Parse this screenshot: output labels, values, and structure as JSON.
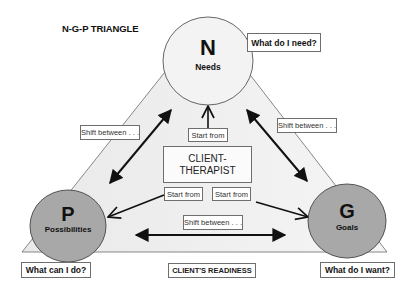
{
  "title": "N-G-P TRIANGLE",
  "nodes": {
    "needs": {
      "letter": "N",
      "name": "Needs",
      "question": "What do I need?"
    },
    "possibilities": {
      "letter": "P",
      "name": "Possibilities",
      "question": "What can I do?"
    },
    "goals": {
      "letter": "G",
      "name": "Goals",
      "question": "What do I want?"
    }
  },
  "center": {
    "line1": "CLIENT-",
    "line2": "THERAPIST"
  },
  "edges": {
    "shift_left": "Shift between . . .",
    "shift_right": "Shift between . . .",
    "shift_bottom": "Shift between . . .",
    "start_top": "Start from",
    "start_left": "Start from",
    "start_right": "Start from"
  },
  "base_label": "CLIENT'S READINESS",
  "colors": {
    "triangle_fill": "#efefef",
    "needs_fill": "#f2f2f2",
    "pg_fill": "#a9a9a9",
    "stroke": "#555555",
    "arrow": "#111111"
  }
}
